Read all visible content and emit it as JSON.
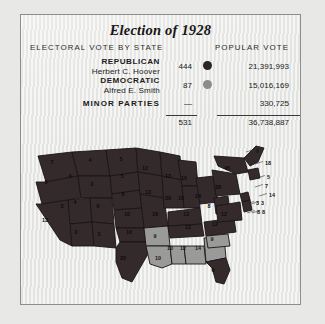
{
  "card": {
    "title": "Election of 1928",
    "col_left": "ELECTORAL VOTE BY STATE",
    "col_right": "POPULAR VOTE"
  },
  "results": {
    "rows": [
      {
        "party": "REPUBLICAN",
        "candidate": "Herbert C. Hoover",
        "electoral": "444",
        "popular": "21,391,993",
        "swatch": "republican-dot",
        "color": "#2c2426"
      },
      {
        "party": "DEMOCRATIC",
        "candidate": "Alfred E. Smith",
        "electoral": "87",
        "popular": "15,016,169",
        "swatch": "democratic-dot",
        "color": "#8d8d8d"
      }
    ],
    "minor": {
      "label": "MINOR PARTIES",
      "electoral": "—",
      "popular": "330,725"
    },
    "total": {
      "electoral": "531",
      "popular": "36,738,887"
    }
  },
  "chart_data": {
    "type": "map",
    "title": "Election of 1928",
    "legend": [
      {
        "name": "Republican (Hoover)",
        "color": "#342a2c"
      },
      {
        "name": "Democratic (Smith)",
        "color": "#9a9a98"
      }
    ],
    "ylabel": "",
    "xlabel": "",
    "state_labels": [
      {
        "state": "WA",
        "value": "7",
        "party": "rep",
        "x": 24,
        "y": 22
      },
      {
        "state": "OR",
        "value": "5",
        "party": "rep",
        "x": 18,
        "y": 42
      },
      {
        "state": "CA",
        "value": "13",
        "party": "rep",
        "x": 17,
        "y": 80
      },
      {
        "state": "NV",
        "value": "3",
        "party": "rep",
        "x": 34,
        "y": 66
      },
      {
        "state": "ID",
        "value": "4",
        "party": "rep",
        "x": 42,
        "y": 36
      },
      {
        "state": "MT",
        "value": "4",
        "party": "rep",
        "x": 62,
        "y": 20
      },
      {
        "state": "WY",
        "value": "3",
        "party": "rep",
        "x": 64,
        "y": 44
      },
      {
        "state": "UT",
        "value": "4",
        "party": "rep",
        "x": 47,
        "y": 62
      },
      {
        "state": "AZ",
        "value": "3",
        "party": "rep",
        "x": 48,
        "y": 92
      },
      {
        "state": "CO",
        "value": "6",
        "party": "rep",
        "x": 70,
        "y": 66
      },
      {
        "state": "NM",
        "value": "3",
        "party": "rep",
        "x": 71,
        "y": 94
      },
      {
        "state": "ND",
        "value": "5",
        "party": "rep",
        "x": 93,
        "y": 19
      },
      {
        "state": "SD",
        "value": "5",
        "party": "rep",
        "x": 94,
        "y": 36
      },
      {
        "state": "NE",
        "value": "8",
        "party": "rep",
        "x": 95,
        "y": 54
      },
      {
        "state": "KS",
        "value": "10",
        "party": "rep",
        "x": 99,
        "y": 74
      },
      {
        "state": "OK",
        "value": "10",
        "party": "rep",
        "x": 101,
        "y": 92
      },
      {
        "state": "TX",
        "value": "20",
        "party": "rep",
        "x": 95,
        "y": 118
      },
      {
        "state": "MN",
        "value": "12",
        "party": "rep",
        "x": 117,
        "y": 28
      },
      {
        "state": "IA",
        "value": "13",
        "party": "rep",
        "x": 120,
        "y": 52
      },
      {
        "state": "MO",
        "value": "18",
        "party": "rep",
        "x": 127,
        "y": 74
      },
      {
        "state": "AR",
        "value": "9",
        "party": "dem",
        "x": 127,
        "y": 96
      },
      {
        "state": "LA",
        "value": "10",
        "party": "dem",
        "x": 130,
        "y": 118
      },
      {
        "state": "WI",
        "value": "13",
        "party": "rep",
        "x": 140,
        "y": 36
      },
      {
        "state": "IL",
        "value": "29",
        "party": "rep",
        "x": 140,
        "y": 58
      },
      {
        "state": "MS",
        "value": "10",
        "party": "dem",
        "x": 142,
        "y": 108
      },
      {
        "state": "MI",
        "value": "15",
        "party": "rep",
        "x": 156,
        "y": 38
      },
      {
        "state": "IN",
        "value": "15",
        "party": "rep",
        "x": 153,
        "y": 58
      },
      {
        "state": "KY",
        "value": "13",
        "party": "rep",
        "x": 158,
        "y": 74
      },
      {
        "state": "TN",
        "value": "12",
        "party": "rep",
        "x": 160,
        "y": 87
      },
      {
        "state": "AL",
        "value": "12",
        "party": "dem",
        "x": 155,
        "y": 108
      },
      {
        "state": "OH",
        "value": "24",
        "party": "rep",
        "x": 170,
        "y": 56
      },
      {
        "state": "GA",
        "value": "14",
        "party": "dem",
        "x": 170,
        "y": 108
      },
      {
        "state": "FL",
        "value": "6",
        "party": "rep",
        "x": 185,
        "y": 130
      },
      {
        "state": "WV",
        "value": "8",
        "party": "rep",
        "x": 181,
        "y": 66
      },
      {
        "state": "NC",
        "value": "12",
        "party": "rep",
        "x": 187,
        "y": 84
      },
      {
        "state": "SC",
        "value": "9",
        "party": "dem",
        "x": 184,
        "y": 99
      },
      {
        "state": "PA",
        "value": "38",
        "party": "rep",
        "x": 190,
        "y": 47
      },
      {
        "state": "VA",
        "value": "12",
        "party": "rep",
        "x": 196,
        "y": 74
      },
      {
        "state": "NY",
        "value": "45",
        "party": "rep",
        "x": 199,
        "y": 28
      }
    ],
    "callouts": [
      {
        "state": "ME",
        "value": "6",
        "x": 228,
        "y": 9
      },
      {
        "state": "VT",
        "value": "18",
        "x": 237,
        "y": 21
      },
      {
        "state": "NH",
        "value": "5",
        "x": 239,
        "y": 35
      },
      {
        "state": "MA",
        "value": "7",
        "x": 237,
        "y": 44
      },
      {
        "state": "RI",
        "value": "14",
        "x": 241,
        "y": 53
      },
      {
        "state": "CT",
        "value": "3",
        "x": 233,
        "y": 61
      },
      {
        "state": "NJ",
        "value": "8",
        "x": 234,
        "y": 70
      },
      {
        "state": "DE",
        "value": "3",
        "x": 228,
        "y": 61
      },
      {
        "state": "MD",
        "value": "8",
        "x": 229,
        "y": 70
      }
    ]
  }
}
